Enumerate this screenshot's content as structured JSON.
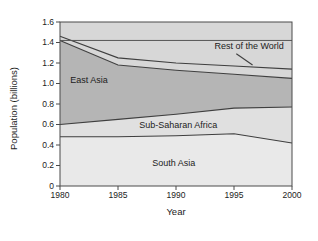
{
  "chart_data": {
    "type": "area",
    "title": "",
    "xlabel": "Year",
    "ylabel": "Population (billions)",
    "x": [
      1980,
      1985,
      1990,
      1995,
      2000
    ],
    "x_tick_labels": [
      "1980",
      "1985",
      "1990",
      "1995",
      "2000"
    ],
    "y_ticks": [
      0,
      0.2,
      0.4,
      0.6,
      0.8,
      1.0,
      1.2,
      1.4,
      1.6
    ],
    "y_tick_labels": [
      "0",
      "0.2",
      "0.4",
      "0.6",
      "0.8",
      "1.0",
      "1.2",
      "1.4",
      "1.6"
    ],
    "xlim": [
      1980,
      2000
    ],
    "ylim": [
      0,
      1.6
    ],
    "grid": false,
    "bands": [
      {
        "name": "South Asia",
        "upper_values": [
          0.48,
          0.48,
          0.49,
          0.51,
          0.42
        ],
        "fill": "#e9e9e9"
      },
      {
        "name": "Sub-Saharan Africa",
        "upper_values": [
          0.6,
          0.65,
          0.7,
          0.76,
          0.77
        ],
        "fill": "#e0e0e0"
      },
      {
        "name": "East Asia",
        "upper_values": [
          1.42,
          1.18,
          1.13,
          1.09,
          1.05
        ],
        "fill": "#b5b5b5"
      },
      {
        "name": "Rest of the World",
        "upper_values": [
          1.46,
          1.25,
          1.2,
          1.17,
          1.14
        ],
        "fill": "#d7d7d7"
      }
    ],
    "reference_line": {
      "value": 1.42
    },
    "annotations": [
      {
        "label": "East Asia",
        "x": 1982.5,
        "y": 1.03
      },
      {
        "label": "Sub-Saharan Africa",
        "x": 1990.2,
        "y": 0.595
      },
      {
        "label": "South Asia",
        "x": 1989.8,
        "y": 0.225
      },
      {
        "label": "Rest of the World",
        "x": 1996.3,
        "y": 1.365,
        "leader_from": {
          "x": 1995.2,
          "y": 1.29
        },
        "leader_to": {
          "x": 1996.6,
          "y": 1.18
        }
      }
    ],
    "colors": {
      "plot_bg": "#d7d7d7",
      "line": "#3f3f3f",
      "frame": "#4a4a4a",
      "reference_line": "#555555",
      "text": "#1c1c1c"
    }
  }
}
